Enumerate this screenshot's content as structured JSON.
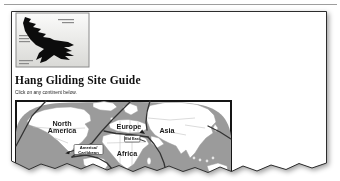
{
  "page": {
    "title": "Hang Gliding Site Guide",
    "instruction": "Click on any continent below."
  },
  "map": {
    "labels": {
      "north_america_line1": "North",
      "north_america_line2": "America",
      "europe": "Europe",
      "asia": "Asia",
      "africa": "Africa",
      "central_america_line1": "America/",
      "central_america_line2": "Caribbean",
      "mid_east": "Mid East"
    },
    "colors": {
      "ocean": "#9b9b9b",
      "land": "#ffffff",
      "region_border": "#333333"
    }
  }
}
